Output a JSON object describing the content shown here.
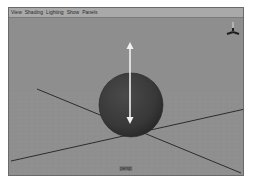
{
  "viewport": {
    "menu": [
      {
        "label": "View"
      },
      {
        "label": "Shading"
      },
      {
        "label": "Lighting"
      },
      {
        "label": "Show"
      },
      {
        "label": "Panels"
      }
    ],
    "camera_label": "persp",
    "colors": {
      "background": "#8e8e8e",
      "grid": "#9a9a9a",
      "axis_line": "#2c2c2c",
      "sphere": "#3a3a3a",
      "manipulator": "#f2f2f2"
    },
    "gizmo": {
      "icon": "view-axis-gizmo-icon"
    },
    "object": {
      "name": "sphere",
      "manipulator": "move-arrow-y"
    }
  }
}
